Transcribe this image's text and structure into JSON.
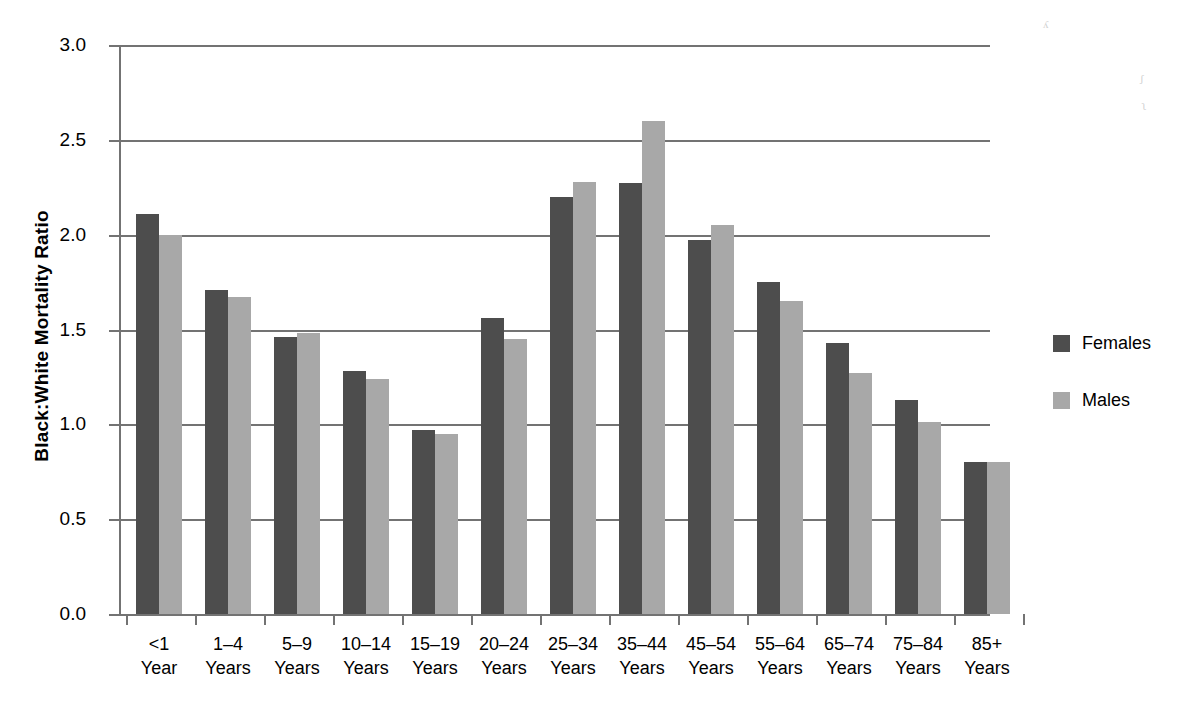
{
  "chart_data": {
    "type": "bar",
    "title": "",
    "xlabel": "",
    "ylabel": "Black:White Mortality  Ratio",
    "ylim": [
      0.0,
      3.0
    ],
    "ytick_labels": [
      "0.0",
      "0.5",
      "1.0",
      "1.5",
      "2.0",
      "2.5",
      "3.0"
    ],
    "ytick_values": [
      0.0,
      0.5,
      1.0,
      1.5,
      2.0,
      2.5,
      3.0
    ],
    "grid": true,
    "legend_position": "right",
    "categories": [
      "<1\nYear",
      "1–4\nYears",
      "5–9\nYears",
      "10–14\nYears",
      "15–19\nYears",
      "20–24\nYears",
      "25–34\nYears",
      "35–44\nYears",
      "45–54\nYears",
      "55–64\nYears",
      "65–74\nYears",
      "75–84\nYears",
      "85+\nYears"
    ],
    "category_lines": [
      [
        "<1",
        "Year"
      ],
      [
        "1–4",
        "Years"
      ],
      [
        "5–9",
        "Years"
      ],
      [
        "10–14",
        "Years"
      ],
      [
        "15–19",
        "Years"
      ],
      [
        "20–24",
        "Years"
      ],
      [
        "25–34",
        "Years"
      ],
      [
        "35–44",
        "Years"
      ],
      [
        "45–54",
        "Years"
      ],
      [
        "55–64",
        "Years"
      ],
      [
        "65–74",
        "Years"
      ],
      [
        "75–84",
        "Years"
      ],
      [
        "85+",
        "Years"
      ]
    ],
    "series": [
      {
        "name": "Females",
        "color": "#4d4d4d",
        "values": [
          2.11,
          1.71,
          1.46,
          1.28,
          0.97,
          1.56,
          2.2,
          2.27,
          1.97,
          1.75,
          1.43,
          1.13,
          0.8
        ]
      },
      {
        "name": "Males",
        "color": "#a8a8a8",
        "values": [
          2.0,
          1.67,
          1.48,
          1.24,
          0.95,
          1.45,
          2.28,
          2.6,
          2.05,
          1.65,
          1.27,
          1.01,
          0.8
        ]
      }
    ]
  },
  "legend": {
    "items": [
      {
        "label": "Females",
        "color": "#4d4d4d"
      },
      {
        "label": "Males",
        "color": "#a8a8a8"
      }
    ]
  },
  "axis": {
    "line_color": "#737373"
  }
}
